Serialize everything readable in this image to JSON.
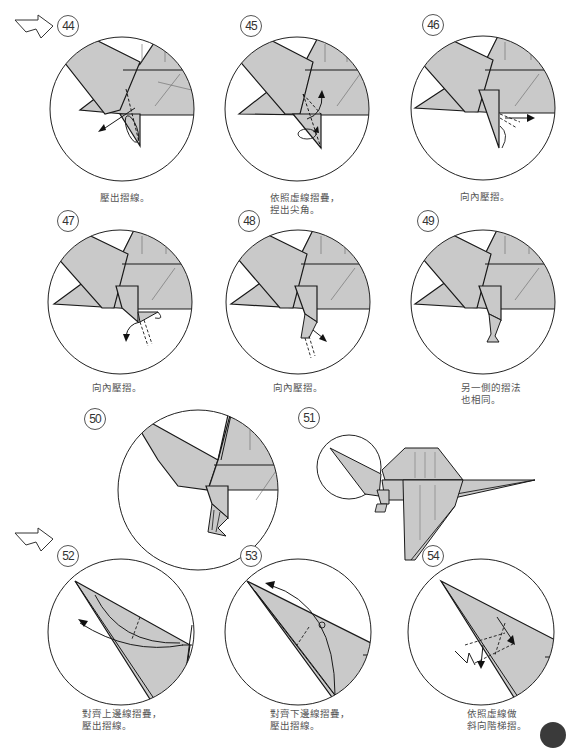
{
  "diagram": {
    "type": "origami-instructions",
    "colors": {
      "paper_fill": "#c9c9c9",
      "line": "#1a1a1a",
      "circle_border": "#222222",
      "caption_text": "#555555",
      "page_marker": "#3a3a3a"
    },
    "continuation_arrows": [
      "top-left",
      "mid-left"
    ],
    "steps": [
      {
        "number": "44",
        "caption_lines": [
          "壓出摺線。"
        ]
      },
      {
        "number": "45",
        "caption_lines": [
          "依照虛線摺疊，",
          "捏出尖角。"
        ]
      },
      {
        "number": "46",
        "caption_lines": [
          "向內壓摺。"
        ]
      },
      {
        "number": "47",
        "caption_lines": [
          "向內壓摺。"
        ]
      },
      {
        "number": "48",
        "caption_lines": [
          "向內壓摺。"
        ]
      },
      {
        "number": "49",
        "caption_lines": [
          "另一側的摺法",
          "也相同。"
        ]
      },
      {
        "number": "50",
        "caption_lines": []
      },
      {
        "number": "51",
        "caption_lines": []
      },
      {
        "number": "52",
        "caption_lines": [
          "對齊上邊線摺疊，",
          "壓出摺線。"
        ]
      },
      {
        "number": "53",
        "caption_lines": [
          "對齊下邊線摺疊，",
          "壓出摺線。"
        ]
      },
      {
        "number": "54",
        "caption_lines": [
          "依照虛線做",
          "斜向階梯摺。"
        ]
      }
    ]
  }
}
